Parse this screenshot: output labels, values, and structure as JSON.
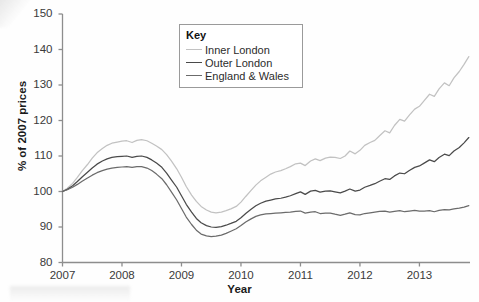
{
  "chart_data": {
    "type": "line",
    "title": "",
    "xlabel": "Year",
    "ylabel": "% of 2007 prices",
    "xlim": [
      2007,
      2013.85
    ],
    "ylim": [
      80,
      150
    ],
    "ytick_labels": [
      "150",
      "140",
      "130",
      "120",
      "110",
      "100",
      "90",
      "80"
    ],
    "ytick_values": [
      150,
      140,
      130,
      120,
      110,
      100,
      90,
      80
    ],
    "xtick_labels": [
      "2007",
      "2008",
      "2009",
      "2010",
      "2011",
      "2012",
      "2013"
    ],
    "xtick_values": [
      2007,
      2008,
      2009,
      2010,
      2011,
      2012,
      2013
    ],
    "grid": false,
    "legend_position": "top-center",
    "legend_title": "Key",
    "series": [
      {
        "name": "Inner London",
        "color": "#c2c2c2",
        "x": [
          2007.0,
          2007.08,
          2007.17,
          2007.25,
          2007.33,
          2007.42,
          2007.5,
          2007.58,
          2007.67,
          2007.75,
          2007.83,
          2007.92,
          2008.0,
          2008.08,
          2008.17,
          2008.25,
          2008.33,
          2008.42,
          2008.5,
          2008.58,
          2008.67,
          2008.75,
          2008.83,
          2008.92,
          2009.0,
          2009.08,
          2009.17,
          2009.25,
          2009.33,
          2009.42,
          2009.5,
          2009.58,
          2009.67,
          2009.75,
          2009.83,
          2009.92,
          2010.0,
          2010.08,
          2010.17,
          2010.25,
          2010.33,
          2010.42,
          2010.5,
          2010.58,
          2010.67,
          2010.75,
          2010.83,
          2010.92,
          2011.0,
          2011.08,
          2011.17,
          2011.25,
          2011.33,
          2011.42,
          2011.5,
          2011.58,
          2011.67,
          2011.75,
          2011.83,
          2011.92,
          2012.0,
          2012.08,
          2012.17,
          2012.25,
          2012.33,
          2012.42,
          2012.5,
          2012.58,
          2012.67,
          2012.75,
          2012.83,
          2012.92,
          2013.0,
          2013.08,
          2013.17,
          2013.25,
          2013.33,
          2013.42,
          2013.5,
          2013.58,
          2013.67,
          2013.75,
          2013.83
        ],
        "values": [
          100.0,
          100.9,
          102.3,
          104.0,
          105.8,
          107.6,
          109.4,
          110.9,
          112.1,
          113.0,
          113.6,
          113.9,
          114.2,
          114.3,
          113.8,
          114.4,
          114.6,
          114.3,
          113.6,
          112.8,
          111.8,
          110.4,
          108.6,
          106.4,
          104.0,
          101.4,
          99.0,
          97.2,
          95.8,
          94.8,
          94.2,
          94.0,
          94.2,
          94.6,
          95.1,
          95.8,
          97.0,
          98.6,
          100.3,
          101.8,
          103.0,
          104.0,
          104.9,
          105.5,
          105.9,
          106.4,
          107.0,
          107.8,
          108.0,
          107.3,
          108.6,
          109.2,
          108.7,
          109.4,
          109.7,
          109.6,
          109.3,
          110.0,
          111.4,
          110.6,
          111.6,
          113.0,
          113.8,
          114.4,
          115.7,
          117.1,
          116.5,
          118.6,
          120.3,
          119.8,
          121.5,
          123.2,
          124.0,
          125.6,
          127.4,
          126.8,
          128.9,
          130.6,
          129.8,
          132.0,
          133.8,
          135.8,
          138.0
        ]
      },
      {
        "name": "Outer London",
        "color": "#4a4a4a",
        "x": [
          2007.0,
          2007.08,
          2007.17,
          2007.25,
          2007.33,
          2007.42,
          2007.5,
          2007.58,
          2007.67,
          2007.75,
          2007.83,
          2007.92,
          2008.0,
          2008.08,
          2008.17,
          2008.25,
          2008.33,
          2008.42,
          2008.5,
          2008.58,
          2008.67,
          2008.75,
          2008.83,
          2008.92,
          2009.0,
          2009.08,
          2009.17,
          2009.25,
          2009.33,
          2009.42,
          2009.5,
          2009.58,
          2009.67,
          2009.75,
          2009.83,
          2009.92,
          2010.0,
          2010.08,
          2010.17,
          2010.25,
          2010.33,
          2010.42,
          2010.5,
          2010.58,
          2010.67,
          2010.75,
          2010.83,
          2010.92,
          2011.0,
          2011.08,
          2011.17,
          2011.25,
          2011.33,
          2011.42,
          2011.5,
          2011.58,
          2011.67,
          2011.75,
          2011.83,
          2011.92,
          2012.0,
          2012.08,
          2012.17,
          2012.25,
          2012.33,
          2012.42,
          2012.5,
          2012.58,
          2012.67,
          2012.75,
          2012.83,
          2012.92,
          2013.0,
          2013.08,
          2013.17,
          2013.25,
          2013.33,
          2013.42,
          2013.5,
          2013.58,
          2013.67,
          2013.75,
          2013.83
        ],
        "values": [
          100.0,
          100.6,
          101.6,
          102.8,
          104.1,
          105.4,
          106.6,
          107.7,
          108.6,
          109.2,
          109.6,
          109.8,
          109.9,
          110.0,
          109.6,
          109.9,
          110.0,
          109.6,
          108.9,
          108.0,
          106.8,
          105.2,
          103.3,
          101.2,
          98.8,
          96.4,
          94.2,
          92.4,
          91.2,
          90.4,
          90.0,
          89.9,
          90.1,
          90.5,
          91.0,
          91.6,
          92.6,
          93.8,
          95.0,
          96.0,
          96.7,
          97.3,
          97.6,
          97.9,
          98.1,
          98.4,
          98.8,
          99.4,
          99.9,
          99.2,
          100.1,
          100.3,
          99.8,
          100.1,
          100.2,
          99.9,
          99.6,
          100.1,
          100.7,
          100.1,
          100.4,
          101.2,
          101.7,
          102.2,
          102.9,
          103.6,
          103.4,
          104.4,
          105.2,
          105.0,
          105.9,
          106.8,
          107.2,
          108.0,
          108.9,
          108.4,
          109.6,
          110.5,
          110.1,
          111.4,
          112.4,
          113.7,
          115.2
        ]
      },
      {
        "name": "England & Wales",
        "color": "#6b6b6b",
        "x": [
          2007.0,
          2007.08,
          2007.17,
          2007.25,
          2007.33,
          2007.42,
          2007.5,
          2007.58,
          2007.67,
          2007.75,
          2007.83,
          2007.92,
          2008.0,
          2008.08,
          2008.17,
          2008.25,
          2008.33,
          2008.42,
          2008.5,
          2008.58,
          2008.67,
          2008.75,
          2008.83,
          2008.92,
          2009.0,
          2009.08,
          2009.17,
          2009.25,
          2009.33,
          2009.42,
          2009.5,
          2009.58,
          2009.67,
          2009.75,
          2009.83,
          2009.92,
          2010.0,
          2010.08,
          2010.17,
          2010.25,
          2010.33,
          2010.42,
          2010.5,
          2010.58,
          2010.67,
          2010.75,
          2010.83,
          2010.92,
          2011.0,
          2011.08,
          2011.17,
          2011.25,
          2011.33,
          2011.42,
          2011.5,
          2011.58,
          2011.67,
          2011.75,
          2011.83,
          2011.92,
          2012.0,
          2012.08,
          2012.17,
          2012.25,
          2012.33,
          2012.42,
          2012.5,
          2012.58,
          2012.67,
          2012.75,
          2012.83,
          2012.92,
          2013.0,
          2013.08,
          2013.17,
          2013.25,
          2013.33,
          2013.42,
          2013.5,
          2013.58,
          2013.67,
          2013.75,
          2013.83
        ],
        "values": [
          100.0,
          100.5,
          101.2,
          102.0,
          102.9,
          103.8,
          104.6,
          105.3,
          105.9,
          106.3,
          106.6,
          106.8,
          106.9,
          107.0,
          106.8,
          107.0,
          107.0,
          106.6,
          105.9,
          104.9,
          103.6,
          101.9,
          99.9,
          97.6,
          95.2,
          92.8,
          90.7,
          89.1,
          88.0,
          87.5,
          87.3,
          87.4,
          87.7,
          88.2,
          88.8,
          89.5,
          90.4,
          91.4,
          92.3,
          93.0,
          93.4,
          93.7,
          93.8,
          93.9,
          94.0,
          94.1,
          94.2,
          94.4,
          94.5,
          93.9,
          94.2,
          94.3,
          93.8,
          93.9,
          93.9,
          93.6,
          93.3,
          93.6,
          94.0,
          93.5,
          93.4,
          93.8,
          94.0,
          94.2,
          94.4,
          94.5,
          94.2,
          94.4,
          94.6,
          94.3,
          94.5,
          94.7,
          94.5,
          94.5,
          94.6,
          94.3,
          94.7,
          94.9,
          94.8,
          95.1,
          95.3,
          95.6,
          96.0
        ]
      }
    ]
  },
  "axes": {
    "y_title": "% of 2007 prices",
    "x_title": "Year"
  },
  "legend": {
    "title": "Key",
    "entries": [
      {
        "label": "Inner London",
        "color": "#c2c2c2"
      },
      {
        "label": "Outer London",
        "color": "#4a4a4a"
      },
      {
        "label": "England & Wales",
        "color": "#6b6b6b"
      }
    ]
  }
}
